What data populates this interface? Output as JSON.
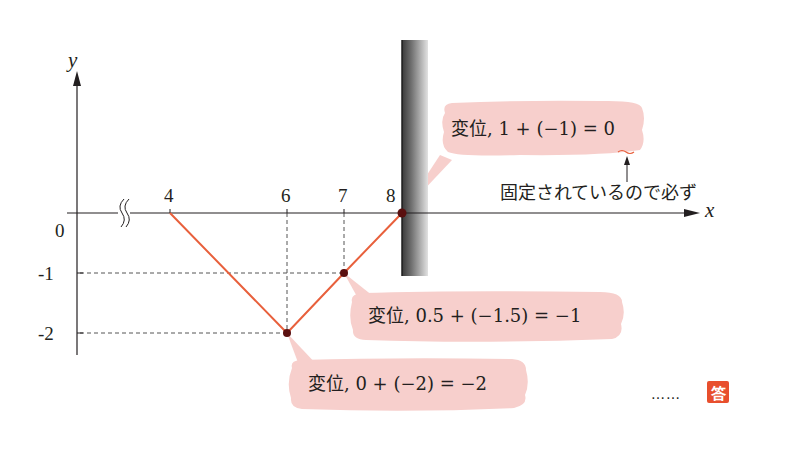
{
  "axes": {
    "y_label": "y",
    "x_label": "x",
    "origin_label": "0",
    "x_ticks": [
      "4",
      "6",
      "7",
      "8"
    ],
    "y_ticks": [
      "0",
      "-1",
      "-2"
    ],
    "axis_break_symbol": "≈"
  },
  "wave": {
    "color": "#e8603c",
    "points": [
      {
        "x": 4,
        "y": 0
      },
      {
        "x": 6,
        "y": -2
      },
      {
        "x": 7,
        "y": -1
      },
      {
        "x": 8,
        "y": 0
      }
    ]
  },
  "wall": {
    "position_x": 8,
    "description": "fixed end (wall)"
  },
  "callouts": [
    {
      "text": "変位, 1 + (−1) = 0",
      "point": {
        "x": 8,
        "y": 0
      }
    },
    {
      "text": "変位, 0.5 + (−1.5) = −1",
      "point": {
        "x": 7,
        "y": -1
      }
    },
    {
      "text": "変位, 0 + (−2) = −2",
      "point": {
        "x": 6,
        "y": -2
      }
    }
  ],
  "note": "固定されているので必ず",
  "answer": {
    "dots": "……",
    "badge": "答"
  },
  "colors": {
    "bubble": "#f7cfcc",
    "wave": "#e8603c",
    "point": "#5a0f0f",
    "answer_badge": "#e84f2d",
    "axis": "#231f20"
  }
}
